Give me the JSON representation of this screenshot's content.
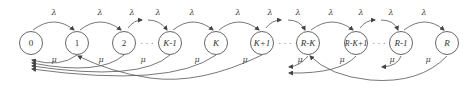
{
  "diagram": {
    "type": "birth-death state transition diagram",
    "nodes": [
      {
        "id": "0",
        "label": "0",
        "x": 31
      },
      {
        "id": "1",
        "label": "1",
        "x": 77
      },
      {
        "id": "2",
        "label": "2",
        "x": 124
      },
      {
        "id": "K-1",
        "label": "K-1",
        "x": 170
      },
      {
        "id": "K",
        "label": "K",
        "x": 216
      },
      {
        "id": "K+1",
        "label": "K+1",
        "x": 262
      },
      {
        "id": "R-K",
        "label": "R-K",
        "x": 308
      },
      {
        "id": "R-K+1",
        "label": "R-K+1",
        "x": 356
      },
      {
        "id": "R-1",
        "label": "R-1",
        "x": 401
      },
      {
        "id": "R",
        "label": "R",
        "x": 447
      }
    ],
    "ellipses": [
      "· · ·",
      "· · ·",
      "· · ·"
    ],
    "arrival_rate_label": "λ",
    "service_rate_label": "μ",
    "forward_edges": [
      {
        "from": "0",
        "to": "1",
        "label": "λ"
      },
      {
        "from": "1",
        "to": "2",
        "label": "λ"
      },
      {
        "from": "2",
        "to": "…",
        "label": "λ"
      },
      {
        "from": "…",
        "to": "K-1",
        "label": "λ"
      },
      {
        "from": "K-1",
        "to": "K",
        "label": "λ"
      },
      {
        "from": "K",
        "to": "K+1",
        "label": "λ"
      },
      {
        "from": "K+1",
        "to": "…",
        "label": "λ"
      },
      {
        "from": "…",
        "to": "R-K",
        "label": "λ"
      },
      {
        "from": "R-K",
        "to": "R-K+1",
        "label": "λ"
      },
      {
        "from": "R-K+1",
        "to": "…",
        "label": "λ"
      },
      {
        "from": "…",
        "to": "R-1",
        "label": "λ"
      },
      {
        "from": "R-1",
        "to": "R",
        "label": "λ"
      }
    ],
    "backward_edges": [
      {
        "from": "1",
        "to": "0",
        "label": "μ"
      },
      {
        "from": "2",
        "to": "0",
        "label": "μ"
      },
      {
        "from": "K-1",
        "to": "0",
        "label": "μ"
      },
      {
        "from": "K",
        "to": "0",
        "label": "μ"
      },
      {
        "from": "K+1",
        "to": "1",
        "label": "μ"
      },
      {
        "from": "R-K",
        "to": "…",
        "label": "μ"
      },
      {
        "from": "R-K+1",
        "to": "…",
        "label": "μ"
      },
      {
        "from": "R-1",
        "to": "…",
        "label": "μ"
      },
      {
        "from": "R",
        "to": "R-K",
        "label": "μ"
      }
    ]
  }
}
